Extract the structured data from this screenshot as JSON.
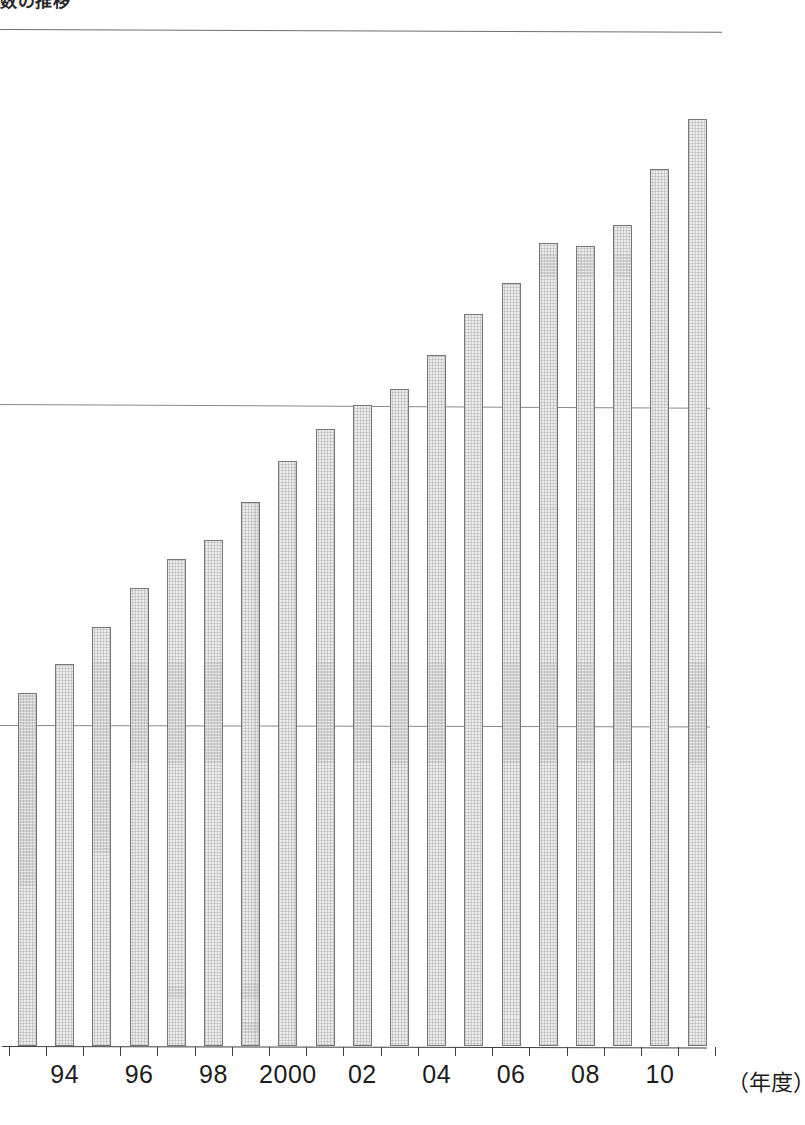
{
  "page": {
    "heading": "数の推移",
    "background_color": "#ffffff"
  },
  "chart_data": {
    "type": "bar",
    "title": "数の推移",
    "xlabel": "（年度）",
    "ylabel": "",
    "grid": true,
    "gridlines_y": [
      2,
      4
    ],
    "legend": "none",
    "ylim": [
      0,
      6
    ],
    "categories": [
      "93",
      "94",
      "95",
      "96",
      "97",
      "98",
      "99",
      "2000",
      "01",
      "02",
      "03",
      "04",
      "05",
      "06",
      "07",
      "08",
      "09",
      "10",
      "11"
    ],
    "tick_labels": [
      "",
      "94",
      "",
      "96",
      "",
      "98",
      "",
      "2000",
      "",
      "02",
      "",
      "04",
      "",
      "06",
      "",
      "08",
      "",
      "10",
      ""
    ],
    "values": [
      2.2,
      2.38,
      2.61,
      2.85,
      3.03,
      3.15,
      3.39,
      3.64,
      3.84,
      3.99,
      4.09,
      4.3,
      4.56,
      4.75,
      5.0,
      4.98,
      5.11,
      5.46,
      5.77
    ],
    "bar_fill_color": "#ececec",
    "bar_border_color": "#777777",
    "axis_color": "#3f3f3f",
    "gridline_color": "#8a8a8a"
  },
  "axis": {
    "unit_label": "（年度）"
  }
}
